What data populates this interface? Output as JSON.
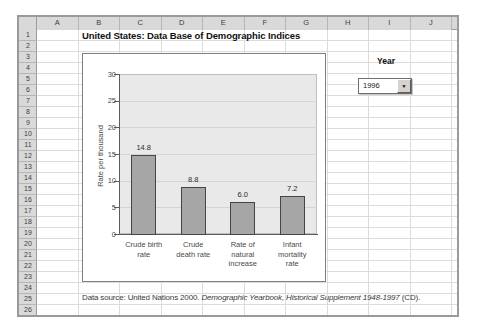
{
  "title": "United States: Data Base of Demographic Indices",
  "spreadsheet": {
    "columns": [
      "A",
      "B",
      "C",
      "D",
      "E",
      "F",
      "G",
      "H",
      "I",
      "J"
    ],
    "rows": [
      "1",
      "2",
      "3",
      "4",
      "5",
      "6",
      "7",
      "8",
      "9",
      "10",
      "11",
      "12",
      "13",
      "14",
      "15",
      "16",
      "17",
      "18",
      "19",
      "20",
      "21",
      "22",
      "23",
      "24",
      "25",
      "26"
    ]
  },
  "year_control": {
    "label": "Year",
    "selected": "1996",
    "dropdown_icon": "chevron-down-icon",
    "arrow_glyph": "▼"
  },
  "source_note": {
    "prefix": "Data source: United Nations 2000. ",
    "italic": "Demographic Yearbook, Historical Supplement 1948-1997",
    "suffix": " (CD)."
  },
  "chart_data": {
    "type": "bar",
    "categories": [
      "Crude birth rate",
      "Crude death rate",
      "Rate of natural increase",
      "Infant mortality rate"
    ],
    "categories_wrapped": [
      "Crude birth\nrate",
      "Crude\ndeath rate",
      "Rate of\nnatural\nincrease",
      "Infant\nmortality\nrate"
    ],
    "values": [
      14.8,
      8.8,
      6.0,
      7.2
    ],
    "value_labels": [
      "14.8",
      "8.8",
      "6.0",
      "7.2"
    ],
    "title": "",
    "xlabel": "",
    "ylabel": "Rate per thousand",
    "ylim": [
      0,
      30
    ],
    "yticks": [
      0,
      5,
      10,
      15,
      20,
      25,
      30
    ],
    "grid": true,
    "legend": false,
    "bar_color": "#a6a6a6",
    "bar_border_color": "#454545",
    "plot_bg": "#e9e9e9"
  }
}
